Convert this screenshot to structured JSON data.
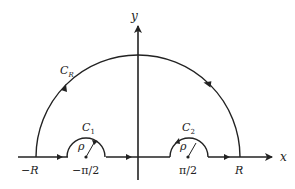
{
  "diagram": {
    "colors": {
      "stroke": "#222222",
      "background": "#ffffff"
    },
    "axes": {
      "x_label": "x",
      "y_label": "y"
    },
    "contours": {
      "big_arc": {
        "label_main": "C",
        "label_sub": "R"
      },
      "indent_left": {
        "label_main": "C",
        "label_sub": "1",
        "radius_label": "ρ"
      },
      "indent_right": {
        "label_main": "C",
        "label_sub": "2",
        "radius_label": "ρ"
      }
    },
    "tick_labels": {
      "neg_R": "−R",
      "neg_pi_half": "−π/2",
      "pi_half": "π/2",
      "R": "R"
    }
  }
}
